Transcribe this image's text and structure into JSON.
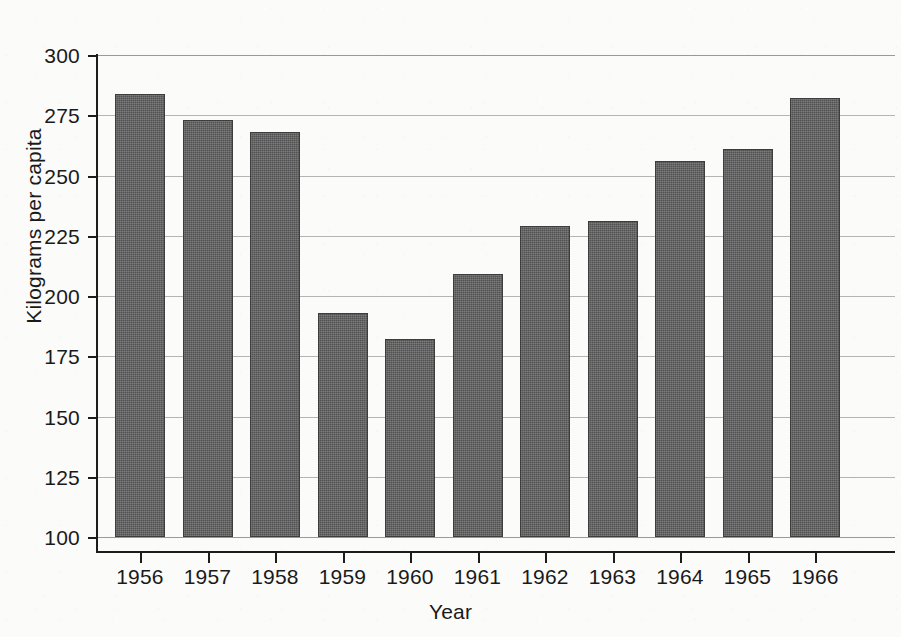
{
  "chart_data": {
    "type": "bar",
    "title": "",
    "xlabel": "Year",
    "ylabel": "Kilograms per capita",
    "categories": [
      "1956",
      "1957",
      "1958",
      "1959",
      "1960",
      "1961",
      "1962",
      "1963",
      "1964",
      "1965",
      "1966"
    ],
    "values": [
      284,
      273,
      268,
      193,
      182,
      209,
      229,
      231,
      256,
      261,
      282
    ],
    "ylim": [
      100,
      300
    ],
    "yticks": [
      100,
      125,
      150,
      175,
      200,
      225,
      250,
      275,
      300
    ],
    "ytick_labels": [
      "100",
      "125",
      "150",
      "175",
      "200",
      "225",
      "250",
      "275",
      "300"
    ],
    "grid": true,
    "grid_axis": "y",
    "legend": false,
    "legend_position": "none",
    "bar_color": "#5d5d5d",
    "background_color": "#fbfbfa",
    "axis_color": "#1c1c1c",
    "gridline_color": "#9a9a9a"
  }
}
